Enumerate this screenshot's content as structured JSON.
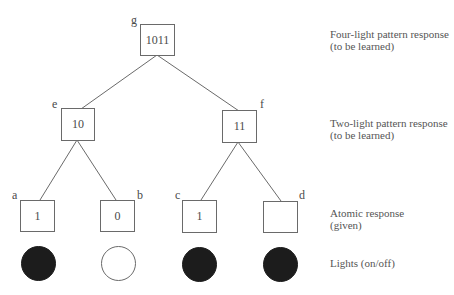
{
  "diagram": {
    "type": "tree",
    "nodes": {
      "g": {
        "letter": "g",
        "value": "1011",
        "level": "four-light"
      },
      "e": {
        "letter": "e",
        "value": "10",
        "level": "two-light"
      },
      "f": {
        "letter": "f",
        "value": "11",
        "level": "two-light"
      },
      "a": {
        "letter": "a",
        "value": "1",
        "level": "atomic"
      },
      "b": {
        "letter": "b",
        "value": "0",
        "level": "atomic"
      },
      "c": {
        "letter": "c",
        "value": "1",
        "level": "atomic"
      },
      "d": {
        "letter": "d",
        "value": "",
        "level": "atomic"
      }
    },
    "edges": [
      [
        "g",
        "e"
      ],
      [
        "g",
        "f"
      ],
      [
        "e",
        "a"
      ],
      [
        "e",
        "b"
      ],
      [
        "f",
        "c"
      ],
      [
        "f",
        "d"
      ]
    ],
    "lights": [
      {
        "id": "light-a",
        "state": "on"
      },
      {
        "id": "light-b",
        "state": "off"
      },
      {
        "id": "light-c",
        "state": "on"
      },
      {
        "id": "light-d",
        "state": "on"
      }
    ],
    "level_labels": {
      "four_light": {
        "line1": "Four-light pattern response",
        "line2": "(to be learned)"
      },
      "two_light": {
        "line1": "Two-light pattern response",
        "line2": "(to be learned)"
      },
      "atomic": {
        "line1": "Atomic response",
        "line2": "(given)"
      },
      "lights": {
        "line1": "Lights (on/off)"
      }
    },
    "colors": {
      "light_on": "#1c1c1c",
      "light_off": "#ffffff",
      "stroke": "#6a6a6a",
      "text": "#555555"
    }
  }
}
